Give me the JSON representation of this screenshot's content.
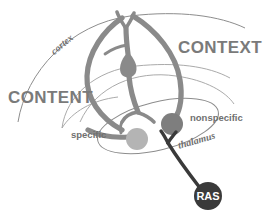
{
  "figure": {
    "labels": {
      "content": "CONTENT",
      "context": "CONTEXT",
      "cortex": "cortex",
      "thalamus": "thalamus",
      "specific": "specific",
      "nonspecific": "nonspecific",
      "ras": "RAS"
    },
    "colors": {
      "background": "#ffffff",
      "arc_stroke": "#8d8d8d",
      "neuron_stroke": "#8a8a8a",
      "soma_specific": "#b4b4b4",
      "soma_nonspecific": "#7e7e7e",
      "ras_fill": "#3a3a3a",
      "ras_axon": "#3a3a3a",
      "major_label": "#7a7a7a",
      "minor_label": "#6f6f6f",
      "ras_text": "#ffffff"
    },
    "elements": {
      "specific_soma_radius": 11,
      "nonspecific_soma_radius": 11,
      "ras_soma_radius": 14
    }
  }
}
